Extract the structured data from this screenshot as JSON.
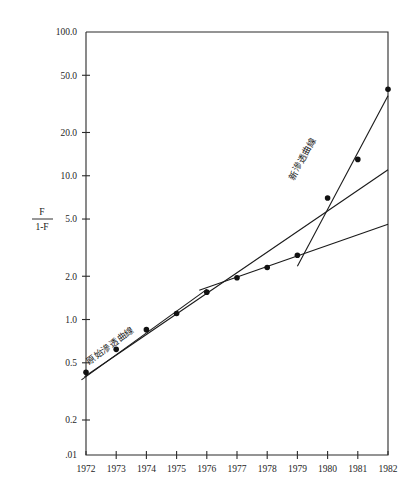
{
  "chart_data": {
    "type": "scatter",
    "title": "",
    "subtitle": "",
    "xlabel": "",
    "ylabel": "F / 1-F",
    "ylabel_numerator": "F",
    "ylabel_denominator": "1-F",
    "y_scale": "log",
    "grid": false,
    "legend_position": "inline-annotations",
    "x": [
      1972,
      1973,
      1974,
      1975,
      1976,
      1977,
      1978,
      1979,
      1980,
      1981,
      1982
    ],
    "xtick_labels": [
      "1972",
      "1973",
      "1974",
      "1975",
      "1976",
      "1977",
      "1978",
      "1979",
      "1980",
      "1981",
      "1982"
    ],
    "ytick_labels": [
      "100.0",
      "50.0",
      "20.0",
      "10.0",
      "5.0",
      "2.0",
      "1.0",
      "0.5",
      "0.2",
      ".01"
    ],
    "ytick_values": [
      100.0,
      50.0,
      20.0,
      10.0,
      5.0,
      2.0,
      1.0,
      0.5,
      0.2,
      0.01
    ],
    "ylim": [
      0.2,
      100.0
    ],
    "xlim": [
      1972,
      1982
    ],
    "series": [
      {
        "name": "F/(1-F) observations",
        "marker": "filled-circle",
        "values": [
          0.43,
          0.62,
          0.85,
          1.1,
          1.55,
          1.95,
          2.3,
          2.8,
          7.0,
          13.0,
          40.0
        ]
      }
    ],
    "trend_lines": [
      {
        "name": "original-penetration-curve",
        "label": "原始滲透曲線",
        "x_start": 1971.85,
        "y_start": 0.38,
        "x_end": 1976.0,
        "y_end": 1.62
      },
      {
        "name": "flat-extension-line",
        "label": "",
        "x_start": 1975.75,
        "y_start": 1.6,
        "x_end": 1982.0,
        "y_end": 4.6
      },
      {
        "name": "medium-growth-line",
        "label": "",
        "x_start": 1971.95,
        "y_start": 0.4,
        "x_end": 1982.0,
        "y_end": 11.0
      },
      {
        "name": "new-penetration-curve",
        "label": "新滲透曲線",
        "x_start": 1979.0,
        "y_start": 2.35,
        "x_end": 1982.0,
        "y_end": 36.0
      }
    ],
    "annotations": [
      {
        "name": "original-curve-label",
        "text": "原始滲透曲線",
        "rotation_deg": -36,
        "x_px": 112,
        "y_px": 348
      },
      {
        "name": "new-curve-label",
        "text": "新滲透曲線",
        "rotation_deg": -62,
        "x_px": 305,
        "y_px": 160
      }
    ],
    "colors": {
      "line": "#1a1a1a",
      "marker": "#111111",
      "axis": "#2b2b2b",
      "background": "#ffffff"
    }
  }
}
